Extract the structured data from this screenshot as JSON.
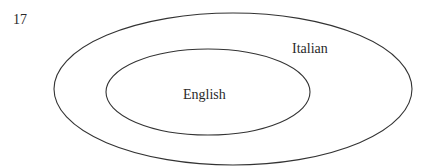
{
  "figure_number": "17",
  "diagram": {
    "type": "nested-sets (Euler diagram)",
    "outer_set": {
      "label": "Italian"
    },
    "inner_set": {
      "label": "English"
    }
  }
}
